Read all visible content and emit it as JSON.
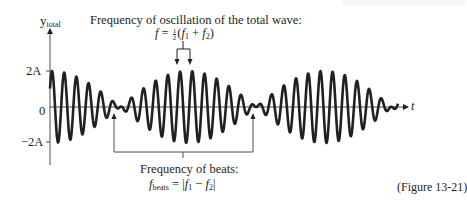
{
  "figure": {
    "caption": "(Figure 13-21)",
    "y_axis_label_main": "y",
    "y_axis_label_sub": "total",
    "x_axis_label": "t",
    "ticks": {
      "pos": "2A",
      "zero": "0",
      "neg": "−2A"
    },
    "top_annotation": {
      "title": "Frequency of oscillation of the total wave:",
      "formula_lhs": "f",
      "formula_eq": " = ",
      "frac_num": "1",
      "frac_den": "2",
      "formula_rhs_open": "(",
      "f1": "f",
      "f1_sub": "1",
      "plus": " + ",
      "f2": "f",
      "f2_sub": "2",
      "formula_rhs_close": ")"
    },
    "bottom_annotation": {
      "title": "Frequency of beats:",
      "lhs": "f",
      "lhs_sub": "beats",
      "eq": " = |",
      "f1": "f",
      "f1_sub": "1",
      "minus": " − ",
      "f2": "f",
      "f2_sub": "2",
      "close": "|"
    },
    "colors": {
      "wave": "#231f20",
      "axis": "#4d4d4d",
      "text": "#231f20"
    },
    "wave": {
      "x_start": 50,
      "x_end": 398,
      "baseline_y": 107,
      "max_amp_px": 36,
      "carrier_period_px": 12.2,
      "beat_period_px": 136,
      "first_max_x": 52
    }
  }
}
